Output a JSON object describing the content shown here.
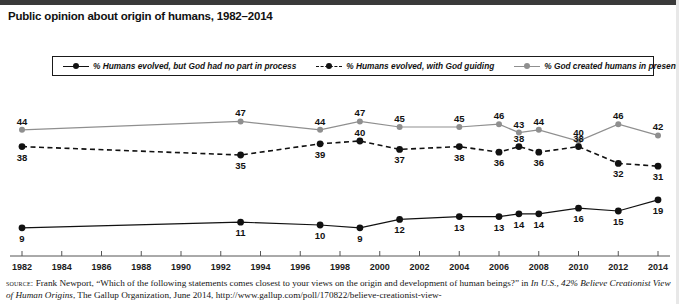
{
  "title": "Public opinion about origin of humans, 1982–2014",
  "legend": {
    "entries": [
      {
        "label": "% Humans evolved, but God had no part in process",
        "style": "solid-black",
        "color": "#111111",
        "icon": "legend-line-marker-icon"
      },
      {
        "label": "% Humans evolved, with God guiding",
        "style": "dashed-black",
        "color": "#111111",
        "icon": "legend-line-marker-icon"
      },
      {
        "label": "% God created humans in present form",
        "style": "solid-gray",
        "color": "#8f8f8f",
        "icon": "legend-line-marker-icon"
      }
    ]
  },
  "source": {
    "kicker": "source:",
    "line1": " Frank Newport, “Which of the following statements comes closest to your views on the origin and development of human beings?” in ",
    "italic1": "In U.S., 42% Believe Creationist View of Human Origins",
    "line2": ", The Gallup Organization, June 2014, http://www.gallup.com/poll/170822/believe-creationist-view-"
  },
  "chart_data": {
    "type": "line",
    "title": "Public opinion about origin of humans, 1982–2014",
    "xlabel": "",
    "ylabel": "",
    "xlim": [
      1982,
      2014
    ],
    "ylim": [
      0,
      50
    ],
    "grid": false,
    "legend_position": "top",
    "x_tick_labels": [
      "1982",
      "1984",
      "1986",
      "1988",
      "1990",
      "1992",
      "1994",
      "1996",
      "1998",
      "2000",
      "2002",
      "2004",
      "2006",
      "2008",
      "2010",
      "2012",
      "2014"
    ],
    "series": [
      {
        "name": "% God created humans in present form",
        "color": "#8f8f8f",
        "line_style": "solid",
        "x": [
          1982,
          1993,
          1997,
          1999,
          2001,
          2004,
          2006,
          2007,
          2008,
          2010,
          2012,
          2014
        ],
        "values": [
          44,
          47,
          44,
          47,
          45,
          45,
          46,
          43,
          44,
          40,
          46,
          42
        ]
      },
      {
        "name": "% Humans evolved, with God guiding",
        "color": "#111111",
        "line_style": "dashed",
        "x": [
          1982,
          1993,
          1997,
          1999,
          2001,
          2004,
          2006,
          2007,
          2008,
          2010,
          2012,
          2014
        ],
        "values": [
          38,
          35,
          39,
          40,
          37,
          38,
          36,
          38,
          36,
          38,
          32,
          31
        ]
      },
      {
        "name": "% Humans evolved, but God had no part in process",
        "color": "#111111",
        "line_style": "solid",
        "x": [
          1982,
          1993,
          1997,
          1999,
          2001,
          2004,
          2006,
          2007,
          2008,
          2010,
          2012,
          2014
        ],
        "values": [
          9,
          11,
          10,
          9,
          12,
          13,
          13,
          14,
          14,
          16,
          15,
          19
        ]
      }
    ]
  }
}
